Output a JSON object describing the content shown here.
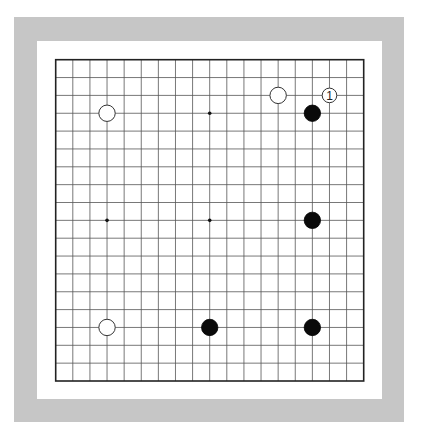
{
  "board": {
    "size": 19,
    "frame_color": "#c6c6c6",
    "star_points": [
      [
        3,
        3
      ],
      [
        9,
        3
      ],
      [
        15,
        3
      ],
      [
        3,
        9
      ],
      [
        9,
        9
      ],
      [
        15,
        9
      ],
      [
        3,
        15
      ],
      [
        9,
        15
      ],
      [
        15,
        15
      ]
    ],
    "stones": [
      {
        "color": "white",
        "col": 13,
        "row": 2,
        "label": ""
      },
      {
        "color": "white",
        "col": 16,
        "row": 2,
        "label": "1"
      },
      {
        "color": "black",
        "col": 15,
        "row": 3,
        "label": ""
      },
      {
        "color": "white",
        "col": 3,
        "row": 3,
        "label": ""
      },
      {
        "color": "black",
        "col": 15,
        "row": 9,
        "label": ""
      },
      {
        "color": "white",
        "col": 3,
        "row": 15,
        "label": ""
      },
      {
        "color": "black",
        "col": 9,
        "row": 15,
        "label": ""
      },
      {
        "color": "black",
        "col": 15,
        "row": 15,
        "label": ""
      }
    ]
  }
}
